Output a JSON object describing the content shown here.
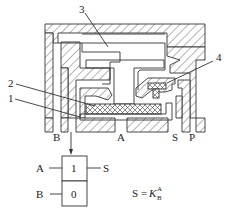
{
  "diagram": {
    "part_labels": [
      {
        "id": "1",
        "text": "1"
      },
      {
        "id": "2",
        "text": "2"
      },
      {
        "id": "3",
        "text": "3"
      },
      {
        "id": "4",
        "text": "4"
      }
    ],
    "port_labels": {
      "B": "B",
      "A": "A",
      "S": "S",
      "P": "P"
    },
    "logic_symbol": {
      "input_a": "A",
      "input_b": "B",
      "output": "S",
      "top_cell": "1",
      "bottom_cell": "0"
    },
    "equation": {
      "lhs": "S",
      "eq": "=",
      "base": "K",
      "sub": "B",
      "sup": "A"
    }
  }
}
